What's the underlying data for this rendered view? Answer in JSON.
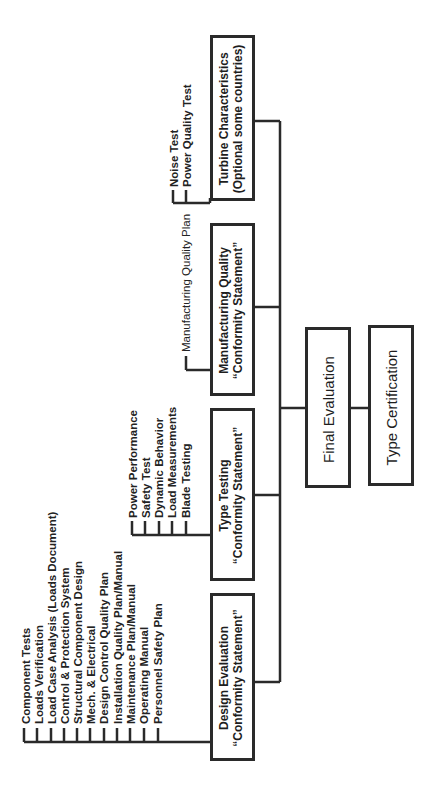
{
  "diagram": {
    "orientation": "rotated-90-ccw",
    "line_color": "#2a2a2a",
    "boxes": {
      "design_evaluation": {
        "line1": "Design Evaluation",
        "line2": "“Conformity Statement”"
      },
      "type_testing": {
        "line1": "Type Testing",
        "line2": "“Conformity Statement”"
      },
      "manufacturing_quality": {
        "line1": "Manufacturing Quality",
        "line2": "“Conformity Statement”"
      },
      "turbine_characteristics": {
        "line1": "Turbine Characteristics",
        "line2": "(Optional some countries)"
      },
      "final_evaluation": {
        "label": "Final Evaluation"
      },
      "type_certification": {
        "label": "Type Certification"
      }
    },
    "design_evaluation_items": [
      "Component Tests",
      "Loads Verification",
      "Load Case Analysis (Loads Document)",
      "Control & Protection System",
      "Structural Component Design",
      "Mech. & Electrical",
      "Design Control Quality Plan",
      "Installation Quality Plan/Manual",
      "Maintenance Plan/Manual",
      "Operating Manual",
      "Personnel Safety Plan"
    ],
    "type_testing_items": [
      "Power Performance",
      "Safety Test",
      "Dynamic Behavior",
      "Load Measurements",
      "Blade Testing"
    ],
    "manufacturing_items": [
      "Manufacturing Quality Plan"
    ],
    "turbine_items": [
      "Noise Test",
      "Power Quality Test"
    ]
  }
}
